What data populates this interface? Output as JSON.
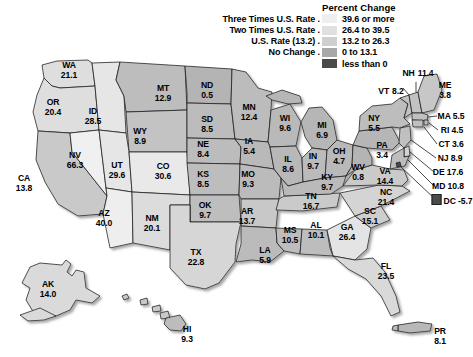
{
  "legend": {
    "title": "Percent Change",
    "rows": [
      {
        "label": "Three Times U.S. Rate .",
        "range": "39.6 or more",
        "color": "#efefef"
      },
      {
        "label": "Two Times U.S. Rate .",
        "range": "26.4 to 39.5",
        "color": "#e0e0e0"
      },
      {
        "label": "U.S. Rate (13.2) .",
        "range": "13.2 to 26.3",
        "color": "#cfcfcf"
      },
      {
        "label": "No Change .",
        "range": "0 to 13.1",
        "color": "#a8a8a8"
      },
      {
        "label": "",
        "range": "less than 0",
        "color": "#4a4a4a"
      }
    ]
  },
  "chart_data": {
    "type": "map",
    "title": "Percent Change",
    "units": "percent change",
    "us_rate": 13.2,
    "bins": [
      {
        "name": "Three Times U.S. Rate",
        "range": "39.6 or more",
        "min": 39.6,
        "max": null,
        "color": "#efefef"
      },
      {
        "name": "Two Times U.S. Rate",
        "range": "26.4 to 39.5",
        "min": 26.4,
        "max": 39.5,
        "color": "#e0e0e0"
      },
      {
        "name": "U.S. Rate (13.2)",
        "range": "13.2 to 26.3",
        "min": 13.2,
        "max": 26.3,
        "color": "#cfcfcf"
      },
      {
        "name": "No Change",
        "range": "0 to 13.1",
        "min": 0,
        "max": 13.1,
        "color": "#a8a8a8"
      },
      {
        "name": "",
        "range": "less than 0",
        "min": null,
        "max": 0,
        "color": "#4a4a4a"
      }
    ],
    "regions": [
      {
        "abbr": "WA",
        "value": 21.1
      },
      {
        "abbr": "OR",
        "value": 20.4
      },
      {
        "abbr": "ID",
        "value": 28.5
      },
      {
        "abbr": "MT",
        "value": 12.9
      },
      {
        "abbr": "ND",
        "value": 0.5
      },
      {
        "abbr": "SD",
        "value": 8.5
      },
      {
        "abbr": "MN",
        "value": 12.4
      },
      {
        "abbr": "WI",
        "value": 9.6
      },
      {
        "abbr": "MI",
        "value": 6.9
      },
      {
        "abbr": "NY",
        "value": 5.5
      },
      {
        "abbr": "VT",
        "value": 8.2
      },
      {
        "abbr": "NH",
        "value": 11.4
      },
      {
        "abbr": "ME",
        "value": 3.8
      },
      {
        "abbr": "MA",
        "value": 5.5
      },
      {
        "abbr": "RI",
        "value": 4.5
      },
      {
        "abbr": "CT",
        "value": 3.6
      },
      {
        "abbr": "NJ",
        "value": 8.9
      },
      {
        "abbr": "DE",
        "value": 17.6
      },
      {
        "abbr": "MD",
        "value": 10.8
      },
      {
        "abbr": "DC",
        "value": -5.7
      },
      {
        "abbr": "PA",
        "value": 3.4
      },
      {
        "abbr": "OH",
        "value": 4.7
      },
      {
        "abbr": "IN",
        "value": 9.7
      },
      {
        "abbr": "IL",
        "value": 8.6
      },
      {
        "abbr": "IA",
        "value": 5.4
      },
      {
        "abbr": "NE",
        "value": 8.4
      },
      {
        "abbr": "WY",
        "value": 8.9
      },
      {
        "abbr": "CO",
        "value": 30.6
      },
      {
        "abbr": "UT",
        "value": 29.6
      },
      {
        "abbr": "NV",
        "value": 66.3
      },
      {
        "abbr": "CA",
        "value": 13.8
      },
      {
        "abbr": "AZ",
        "value": 40.0
      },
      {
        "abbr": "NM",
        "value": 20.1
      },
      {
        "abbr": "KS",
        "value": 8.5
      },
      {
        "abbr": "MO",
        "value": 9.3
      },
      {
        "abbr": "OK",
        "value": 9.7
      },
      {
        "abbr": "AR",
        "value": 13.7
      },
      {
        "abbr": "TX",
        "value": 22.8
      },
      {
        "abbr": "LA",
        "value": 5.9
      },
      {
        "abbr": "MS",
        "value": 10.5
      },
      {
        "abbr": "AL",
        "value": 10.1
      },
      {
        "abbr": "GA",
        "value": 26.4
      },
      {
        "abbr": "TN",
        "value": 16.7
      },
      {
        "abbr": "KY",
        "value": 9.7
      },
      {
        "abbr": "WV",
        "value": 0.8
      },
      {
        "abbr": "VA",
        "value": 14.4
      },
      {
        "abbr": "NC",
        "value": 21.4
      },
      {
        "abbr": "SC",
        "value": 15.1
      },
      {
        "abbr": "FL",
        "value": 23.5
      },
      {
        "abbr": "AK",
        "value": 14.0
      },
      {
        "abbr": "HI",
        "value": 9.3
      },
      {
        "abbr": "PR",
        "value": 8.1
      }
    ]
  },
  "map": {
    "labels": [
      {
        "name": "WA",
        "abbr": "WA",
        "value": "21.1",
        "x": 69,
        "y": 71,
        "style": "stack"
      },
      {
        "name": "OR",
        "abbr": "OR",
        "value": "20.4",
        "x": 53,
        "y": 108,
        "style": "stack"
      },
      {
        "name": "ID",
        "abbr": "ID",
        "value": "28.5",
        "x": 93,
        "y": 117,
        "style": "stack"
      },
      {
        "name": "MT",
        "abbr": "MT",
        "value": "12.9",
        "x": 163,
        "y": 94,
        "style": "stack"
      },
      {
        "name": "ND",
        "abbr": "ND",
        "value": "0.5",
        "x": 207,
        "y": 91,
        "style": "stack"
      },
      {
        "name": "SD",
        "abbr": "SD",
        "value": "8.5",
        "x": 207,
        "y": 125,
        "style": "stack"
      },
      {
        "name": "MN",
        "abbr": "MN",
        "value": "12.4",
        "x": 249,
        "y": 113,
        "style": "stack"
      },
      {
        "name": "WI",
        "abbr": "WI",
        "value": "9.6",
        "x": 285,
        "y": 124,
        "style": "stack"
      },
      {
        "name": "MI",
        "abbr": "MI",
        "value": "6.9",
        "x": 322,
        "y": 131,
        "style": "stack"
      },
      {
        "name": "NY",
        "abbr": "NY",
        "value": "5.5",
        "x": 374,
        "y": 124,
        "style": "stack"
      },
      {
        "name": "PA",
        "abbr": "PA",
        "value": "3.4",
        "x": 382,
        "y": 151,
        "style": "stack"
      },
      {
        "name": "WY",
        "abbr": "WY",
        "value": "8.9",
        "x": 140,
        "y": 137,
        "style": "stack"
      },
      {
        "name": "NV",
        "abbr": "NV",
        "value": "66.3",
        "x": 75,
        "y": 161,
        "style": "stack"
      },
      {
        "name": "UT",
        "abbr": "UT",
        "value": "29.6",
        "x": 117,
        "y": 171,
        "style": "stack"
      },
      {
        "name": "CO",
        "abbr": "CO",
        "value": "30.6",
        "x": 163,
        "y": 172,
        "style": "stack"
      },
      {
        "name": "NE",
        "abbr": "NE",
        "value": "8.4",
        "x": 203,
        "y": 150,
        "style": "stack"
      },
      {
        "name": "IA",
        "abbr": "IA",
        "value": "5.4",
        "x": 249,
        "y": 147,
        "style": "stack"
      },
      {
        "name": "IL",
        "abbr": "IL",
        "value": "8.6",
        "x": 288,
        "y": 165,
        "style": "stack"
      },
      {
        "name": "IN",
        "abbr": "IN",
        "value": "9.7",
        "x": 313,
        "y": 162,
        "style": "stack"
      },
      {
        "name": "OH",
        "abbr": "OH",
        "value": "4.7",
        "x": 339,
        "y": 157,
        "style": "stack"
      },
      {
        "name": "CA",
        "abbr": "CA",
        "value": "13.8",
        "x": 24,
        "y": 184,
        "style": "stack"
      },
      {
        "name": "KS",
        "abbr": "KS",
        "value": "8.5",
        "x": 203,
        "y": 180,
        "style": "stack"
      },
      {
        "name": "MO",
        "abbr": "MO",
        "value": "9.3",
        "x": 248,
        "y": 180,
        "style": "stack"
      },
      {
        "name": "KY",
        "abbr": "KY",
        "value": "9.7",
        "x": 327,
        "y": 183,
        "style": "stack"
      },
      {
        "name": "WV",
        "abbr": "WV",
        "value": "0.8",
        "x": 358,
        "y": 173,
        "style": "stack"
      },
      {
        "name": "VA",
        "abbr": "VA",
        "value": "14.4",
        "x": 385,
        "y": 177,
        "style": "stack"
      },
      {
        "name": "AZ",
        "abbr": "AZ",
        "value": "40.0",
        "x": 104,
        "y": 219,
        "style": "stack"
      },
      {
        "name": "NM",
        "abbr": "NM",
        "value": "20.1",
        "x": 152,
        "y": 224,
        "style": "stack"
      },
      {
        "name": "OK",
        "abbr": "OK",
        "value": "9.7",
        "x": 205,
        "y": 211,
        "style": "stack"
      },
      {
        "name": "AR",
        "abbr": "AR",
        "value": "13.7",
        "x": 247,
        "y": 217,
        "style": "stack"
      },
      {
        "name": "TN",
        "abbr": "TN",
        "value": "16.7",
        "x": 311,
        "y": 202,
        "style": "stack"
      },
      {
        "name": "NC",
        "abbr": "NC",
        "value": "21.4",
        "x": 386,
        "y": 198,
        "style": "stack"
      },
      {
        "name": "SC",
        "abbr": "SC",
        "value": "15.1",
        "x": 370,
        "y": 217,
        "style": "stack"
      },
      {
        "name": "MS",
        "abbr": "MS",
        "value": "10.5",
        "x": 290,
        "y": 236,
        "style": "stack"
      },
      {
        "name": "AL",
        "abbr": "AL",
        "value": "10.1",
        "x": 316,
        "y": 231,
        "style": "stack"
      },
      {
        "name": "GA",
        "abbr": "GA",
        "value": "26.4",
        "x": 347,
        "y": 233,
        "style": "stack"
      },
      {
        "name": "LA",
        "abbr": "LA",
        "value": "5.9",
        "x": 265,
        "y": 256,
        "style": "stack"
      },
      {
        "name": "TX",
        "abbr": "TX",
        "value": "22.8",
        "x": 196,
        "y": 258,
        "style": "stack"
      },
      {
        "name": "FL",
        "abbr": "FL",
        "value": "23.5",
        "x": 386,
        "y": 272,
        "style": "stack"
      },
      {
        "name": "AK",
        "abbr": "AK",
        "value": "14.0",
        "x": 48,
        "y": 290,
        "style": "stack"
      },
      {
        "name": "HI",
        "abbr": "HI",
        "value": "9.3",
        "x": 187,
        "y": 335,
        "style": "stack"
      },
      {
        "name": "PR",
        "abbr": "PR",
        "value": "8.1",
        "x": 440,
        "y": 337,
        "style": "stack"
      },
      {
        "name": "NH",
        "abbr": "NH",
        "value": "11.4",
        "x": 418,
        "y": 73,
        "style": "split-nh"
      },
      {
        "name": "VT",
        "abbr": "VT",
        "value": "8.2",
        "x": 391,
        "y": 91,
        "style": "split-vt"
      },
      {
        "name": "ME",
        "abbr": "ME",
        "value": "3.8",
        "x": 445,
        "y": 91,
        "style": "stack"
      },
      {
        "name": "MA",
        "abbr": "MA",
        "value": "MA 5.5",
        "x": 451,
        "y": 116,
        "style": "inline"
      },
      {
        "name": "RI",
        "abbr": "RI",
        "value": "RI 4.5",
        "x": 452,
        "y": 130,
        "style": "inline"
      },
      {
        "name": "CT",
        "abbr": "CT",
        "value": "CT 3.6",
        "x": 451,
        "y": 144,
        "style": "inline"
      },
      {
        "name": "NJ",
        "abbr": "NJ",
        "value": "NJ 8.9",
        "x": 450,
        "y": 158,
        "style": "inline"
      },
      {
        "name": "DE",
        "abbr": "DE",
        "value": "DE 17.6",
        "x": 448,
        "y": 172,
        "style": "inline"
      },
      {
        "name": "MD",
        "abbr": "MD",
        "value": "MD 10.8",
        "x": 448,
        "y": 186,
        "style": "inline"
      },
      {
        "name": "DC",
        "abbr": "DC",
        "value": "DC -5.7",
        "x": 452,
        "y": 200,
        "style": "inline-dc"
      }
    ]
  }
}
